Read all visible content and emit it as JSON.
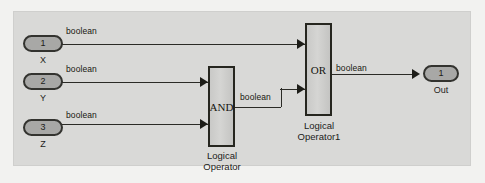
{
  "diagram": {
    "type": "simulink-block-diagram",
    "canvas_color": "#d9d9d7",
    "outer_color": "#f2f2f0",
    "block_fill": "#cdcdcb",
    "port_fill": "#a8a8a6",
    "line_color": "#2b2b26"
  },
  "inputs": [
    {
      "number": "1",
      "name": "X",
      "signal": "boolean"
    },
    {
      "number": "2",
      "name": "Y",
      "signal": "boolean"
    },
    {
      "number": "3",
      "name": "Z",
      "signal": "boolean"
    }
  ],
  "blocks": [
    {
      "id": "and",
      "operator": "AND",
      "caption_line1": "Logical",
      "caption_line2": "Operator",
      "output_signal": "boolean"
    },
    {
      "id": "or",
      "operator": "OR",
      "caption_line1": "Logical",
      "caption_line2": "Operator1",
      "output_signal": "boolean"
    }
  ],
  "outputs": [
    {
      "number": "1",
      "name": "Out"
    }
  ]
}
